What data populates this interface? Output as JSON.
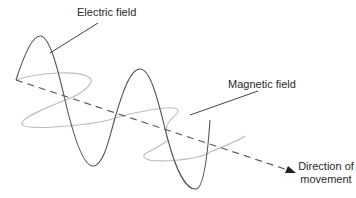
{
  "diagram": {
    "labels": {
      "electric_field": "Electric field",
      "magnetic_field": "Magnetic field",
      "direction_line1": "Direction of",
      "direction_line2": "movement"
    },
    "colors": {
      "electric_wave": "#555555",
      "magnetic_wave": "#bdbdbd",
      "axis": "#555555",
      "leader_line": "#444444",
      "text": "#2a2a2a",
      "background": "#ffffff"
    },
    "elements": [
      {
        "name": "electric-field-wave",
        "type": "sinusoid",
        "plane": "vertical"
      },
      {
        "name": "magnetic-field-wave",
        "type": "sinusoid",
        "plane": "horizontal"
      },
      {
        "name": "propagation-axis",
        "type": "dashed-arrow"
      }
    ]
  }
}
